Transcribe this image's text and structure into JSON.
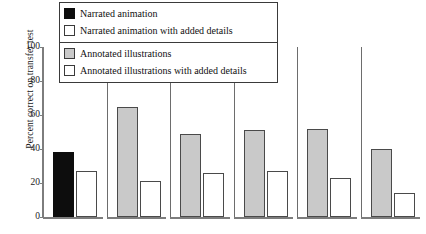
{
  "chart_data": {
    "type": "bar",
    "title": "",
    "xlabel": "",
    "ylabel": "Percent correct on transfer test",
    "ylim": [
      0,
      100
    ],
    "yticks": [
      0,
      20,
      40,
      60,
      80,
      100
    ],
    "ytick_labels": [
      "0",
      "20",
      "40",
      "60",
      "80",
      "100"
    ],
    "grid": false,
    "legend_position": "top-center",
    "categories": [
      "1",
      "2",
      "3",
      "4",
      "5",
      "6"
    ],
    "series": [
      {
        "name": "Narrated animation",
        "color": "#0d0d0d",
        "values": [
          38,
          null,
          null,
          null,
          null,
          null
        ]
      },
      {
        "name": "Narrated animation with added details",
        "color": "#ffffff",
        "values": [
          27,
          null,
          null,
          null,
          null,
          null
        ]
      },
      {
        "name": "Annotated illustrations",
        "color": "#c9c9c9",
        "values": [
          null,
          65,
          49,
          51,
          52,
          40
        ]
      },
      {
        "name": "Annotated illustrations with added details",
        "color": "#ffffff",
        "values": [
          null,
          21,
          26,
          27,
          23,
          14
        ]
      }
    ],
    "groups": [
      {
        "index": 0,
        "primary_value": 38,
        "primary_style": "black",
        "secondary_value": 27,
        "secondary_style": "white"
      },
      {
        "index": 1,
        "primary_value": 65,
        "primary_style": "gray",
        "secondary_value": 21,
        "secondary_style": "white"
      },
      {
        "index": 2,
        "primary_value": 49,
        "primary_style": "gray",
        "secondary_value": 26,
        "secondary_style": "white"
      },
      {
        "index": 3,
        "primary_value": 51,
        "primary_style": "gray",
        "secondary_value": 27,
        "secondary_style": "white"
      },
      {
        "index": 4,
        "primary_value": 52,
        "primary_style": "gray",
        "secondary_value": 23,
        "secondary_style": "white"
      },
      {
        "index": 5,
        "primary_value": 40,
        "primary_style": "gray",
        "secondary_value": 14,
        "secondary_style": "white"
      }
    ]
  },
  "axis": {
    "y_label": "Percent correct on transfer test",
    "y_ticks": [
      {
        "value": 100,
        "label": "100"
      },
      {
        "value": 80,
        "label": "80"
      },
      {
        "value": 60,
        "label": "60"
      },
      {
        "value": 40,
        "label": "40"
      },
      {
        "value": 20,
        "label": "20"
      },
      {
        "value": 0,
        "label": "0"
      }
    ]
  },
  "legend": {
    "blocks": [
      {
        "items": [
          {
            "label": "Narrated animation",
            "swatch": "black"
          },
          {
            "label": "Narrated animation with added details",
            "swatch": "white"
          }
        ]
      },
      {
        "items": [
          {
            "label": "Annotated illustrations",
            "swatch": "gray"
          },
          {
            "label": "Annotated illustrations with added details",
            "swatch": "white"
          }
        ]
      }
    ]
  },
  "colors": {
    "black_fill": "#0d0d0d",
    "gray_fill": "#c9c9c9",
    "white_fill": "#ffffff",
    "outline": "#3a3a3a",
    "axis": "#7d7d7d"
  }
}
